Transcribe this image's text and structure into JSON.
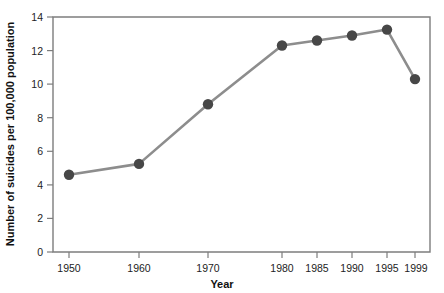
{
  "chart_data": {
    "type": "line",
    "title": "",
    "xlabel": "Year",
    "ylabel": "Number of suicides per 100,000 population",
    "x": [
      1950,
      1960,
      1970,
      1980,
      1985,
      1990,
      1995,
      1999
    ],
    "categories": [
      "1950",
      "1960",
      "1970",
      "1980",
      "1985",
      "1990",
      "1995",
      "1999"
    ],
    "values": [
      4.6,
      5.25,
      8.8,
      12.3,
      12.6,
      12.9,
      13.25,
      10.3
    ],
    "series": [
      {
        "name": "Suicide rate",
        "values": [
          4.6,
          5.25,
          8.8,
          12.3,
          12.6,
          12.9,
          13.25,
          10.3
        ]
      }
    ],
    "xtick_labels": [
      "1950",
      "1960",
      "1970",
      "1980",
      "1985",
      "1990",
      "1995",
      "1999"
    ],
    "xtick_positions": [
      69,
      139,
      208,
      282,
      317,
      352,
      387,
      415
    ],
    "ytick_labels": [
      "0",
      "2",
      "4",
      "6",
      "8",
      "10",
      "12",
      "14"
    ],
    "ytick_values": [
      0,
      2,
      4,
      6,
      8,
      10,
      12,
      14
    ],
    "ylim": [
      0,
      14
    ],
    "grid": false,
    "legend": "none",
    "line_color": "#8d8d8d",
    "marker_color": "#474747",
    "axis_color": "#7d7d7d",
    "text_color": "#1a1a1a",
    "background": "#ffffff"
  }
}
